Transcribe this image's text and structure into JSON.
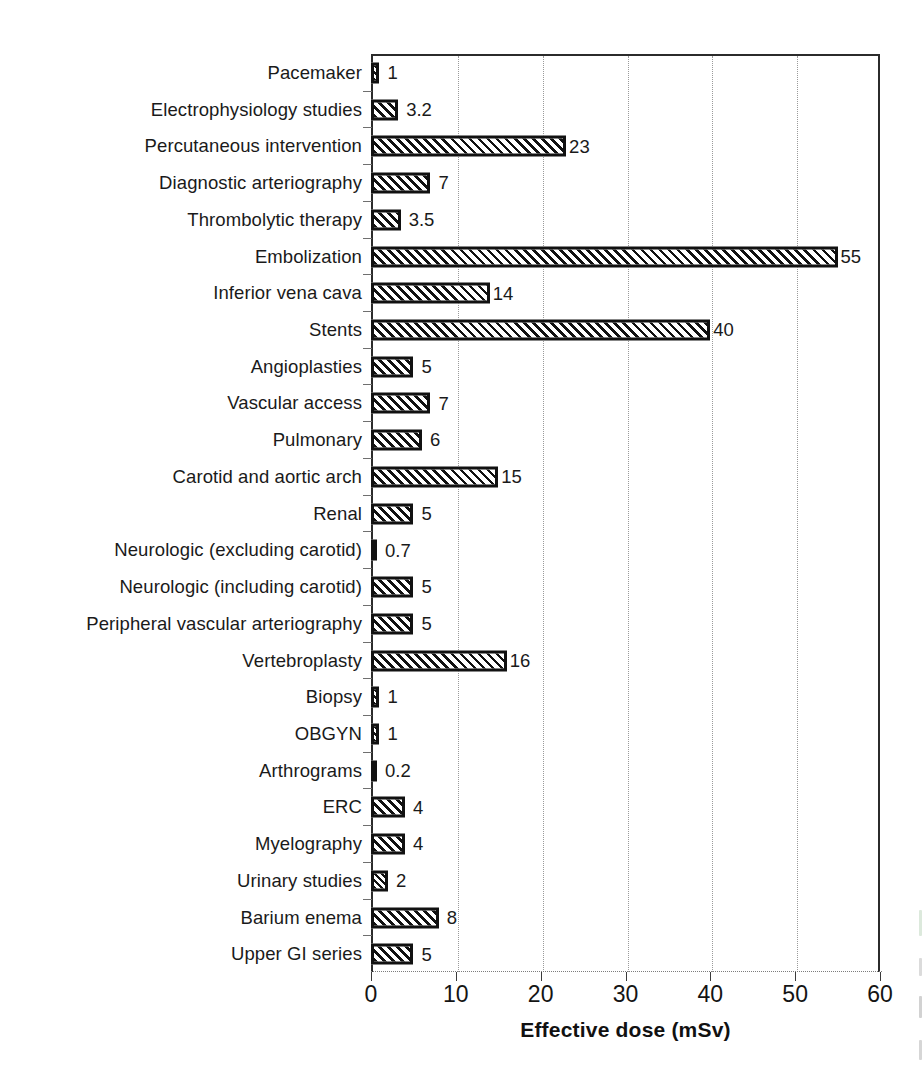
{
  "chart_data": {
    "type": "bar",
    "orientation": "horizontal",
    "title": "",
    "xlabel": "Effective dose (mSv)",
    "ylabel": "",
    "xlim": [
      0,
      60
    ],
    "xticks": [
      0,
      10,
      20,
      30,
      40,
      50,
      60
    ],
    "xtick_labels": [
      "0",
      "10",
      "20",
      "30",
      "40",
      "50",
      "60"
    ],
    "grid": "vertical-dotted",
    "legend": "none",
    "bar_style": "diagonal-hatch-black-on-white",
    "categories": [
      "Pacemaker",
      "Electrophysiology studies",
      "Percutaneous intervention",
      "Diagnostic arteriography",
      "Thrombolytic therapy",
      "Embolization",
      "Inferior vena cava",
      "Stents",
      "Angioplasties",
      "Vascular access",
      "Pulmonary",
      "Carotid and aortic arch",
      "Renal",
      "Neurologic (excluding carotid)",
      "Neurologic (including carotid)",
      "Peripheral vascular arteriography",
      "Vertebroplasty",
      "Biopsy",
      "OBGYN",
      "Arthrograms",
      "ERC",
      "Myelography",
      "Urinary studies",
      "Barium enema",
      "Upper GI series"
    ],
    "values": [
      1,
      3.2,
      23,
      7,
      3.5,
      55,
      14,
      40,
      5,
      7,
      6,
      15,
      5,
      0.7,
      5,
      5,
      16,
      1,
      1,
      0.2,
      4,
      4,
      2,
      8,
      5
    ],
    "value_labels": [
      "1",
      "3.2",
      "23",
      "7",
      "3.5",
      "55",
      "14",
      "40",
      "5",
      "7",
      "6",
      "15",
      "5",
      "0.7",
      "5",
      "5",
      "16",
      "1",
      "1",
      "0.2",
      "4",
      "4",
      "2",
      "8",
      "5"
    ]
  },
  "colors": {
    "background": "#ffffff",
    "bar_outline": "#111111",
    "bar_hatch": "#111111",
    "bar_fill": "#ffffff",
    "axis": "#2b2b2b",
    "gridline": "#9a9a9a",
    "text": "#1a1a1a"
  }
}
